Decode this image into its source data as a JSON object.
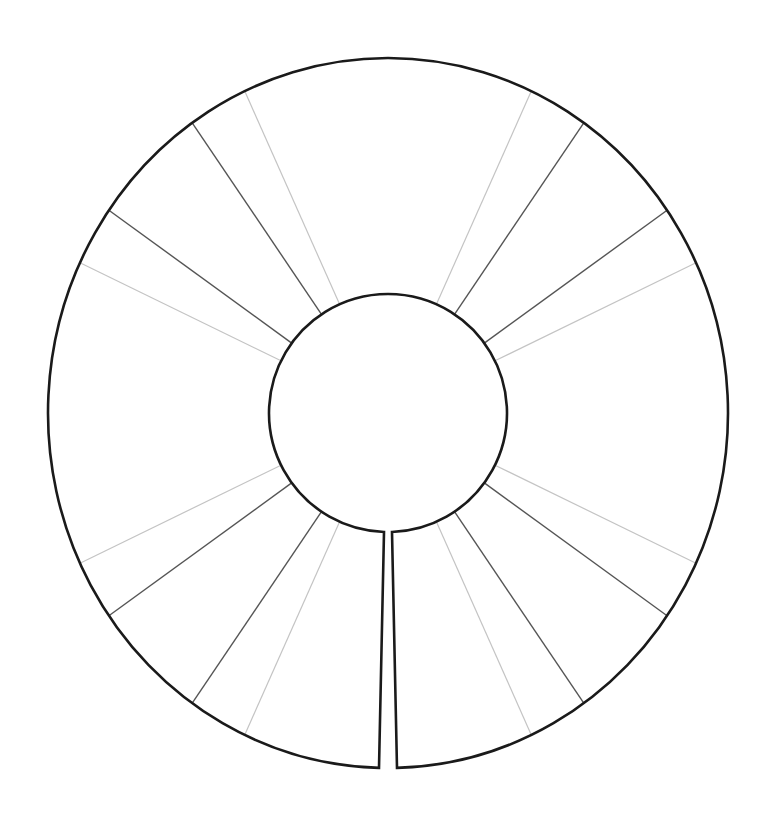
{
  "diagram": {
    "type": "segmented-ring-template",
    "background": "#ffffff",
    "center": [
      388,
      413
    ],
    "outer": {
      "rx": 340,
      "ry": 355,
      "stroke": "#1a1a1a",
      "width": 2.6
    },
    "inner": {
      "r": 119,
      "stroke": "#1a1a1a",
      "width": 2.6
    },
    "slit": {
      "position": "bottom",
      "inner_left_x": 384,
      "inner_right_x": 392,
      "outer_left_x": 379,
      "outer_right_x": 397
    },
    "spokes": [
      {
        "angle": 24,
        "tone": "light"
      },
      {
        "angle": 34,
        "tone": "dark"
      },
      {
        "angle": 54,
        "tone": "dark"
      },
      {
        "angle": 64,
        "tone": "light"
      },
      {
        "angle": 116,
        "tone": "light"
      },
      {
        "angle": 126,
        "tone": "dark"
      },
      {
        "angle": 146,
        "tone": "dark"
      },
      {
        "angle": 156,
        "tone": "light"
      },
      {
        "angle": -24,
        "tone": "light"
      },
      {
        "angle": -34,
        "tone": "dark"
      },
      {
        "angle": -54,
        "tone": "dark"
      },
      {
        "angle": -64,
        "tone": "light"
      },
      {
        "angle": -116,
        "tone": "light"
      },
      {
        "angle": -126,
        "tone": "dark"
      },
      {
        "angle": -146,
        "tone": "dark"
      },
      {
        "angle": -156,
        "tone": "light"
      }
    ],
    "tones": {
      "dark": {
        "stroke": "#555555",
        "width": 1.4
      },
      "light": {
        "stroke": "#c4c4c4",
        "width": 1.2
      }
    }
  }
}
